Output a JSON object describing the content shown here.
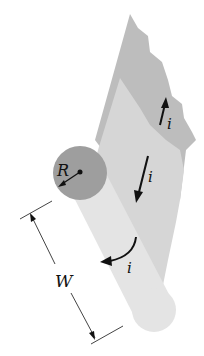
{
  "diagram": {
    "labels": {
      "radius": "R",
      "width": "W",
      "current_upper": "i",
      "current_middle": "i",
      "current_cylinder": "i"
    },
    "colors": {
      "background": "#ffffff",
      "back_sheet": "#bdbdbd",
      "front_sheet": "#d6d6d6",
      "cylinder_body": "#e4e4e4",
      "cylinder_end": "#9e9e9e",
      "ink": "#111111"
    }
  }
}
